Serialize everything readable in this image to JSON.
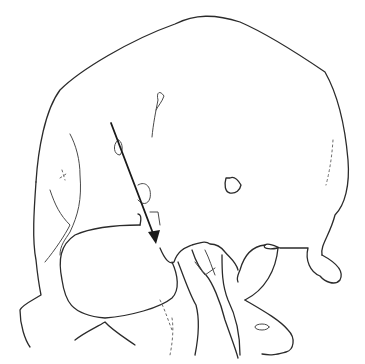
{
  "figure": {
    "subject": "skull line drawing, frontal-oblique view",
    "stroke_color": "#2b2b2b",
    "background": "#ffffff",
    "annotation": {
      "type": "arrow",
      "from": [
        111,
        123
      ],
      "to": [
        156,
        243
      ],
      "color": "#1a1a1a"
    }
  }
}
